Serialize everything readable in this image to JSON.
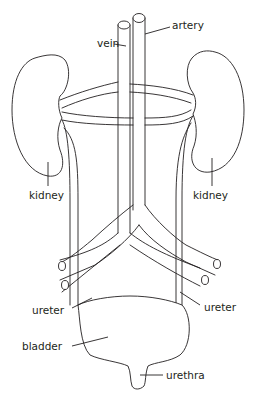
{
  "diagram": {
    "labels": {
      "vein": "vein",
      "artery": "artery",
      "kidney_left": "kidney",
      "kidney_right": "kidney",
      "ureter_left": "ureter",
      "ureter_right": "ureter",
      "bladder": "bladder",
      "urethra": "urethra"
    },
    "colors": {
      "line": "#231f20",
      "background": "#ffffff"
    }
  }
}
